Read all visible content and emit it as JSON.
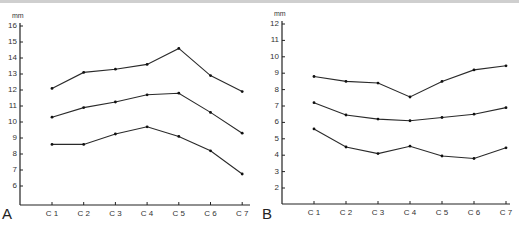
{
  "chart_data": [
    {
      "type": "line",
      "panel_label": "A",
      "title": "",
      "xlabel": "",
      "ylabel": "mm",
      "categories": [
        "C1",
        "C2",
        "C3",
        "C4",
        "C5",
        "C6",
        "C7"
      ],
      "yticks": [
        6,
        7,
        8,
        9,
        10,
        11,
        12,
        13,
        14,
        15,
        16
      ],
      "ylim": [
        5,
        16
      ],
      "grid": false,
      "legend": null,
      "series": [
        {
          "name": "upper",
          "values": [
            12.1,
            13.1,
            13.3,
            13.6,
            14.6,
            12.9,
            11.9
          ]
        },
        {
          "name": "middle",
          "values": [
            10.3,
            10.9,
            11.25,
            11.7,
            11.8,
            10.6,
            9.3
          ]
        },
        {
          "name": "lower",
          "values": [
            8.6,
            8.6,
            9.25,
            9.7,
            9.1,
            8.2,
            6.75
          ]
        }
      ]
    },
    {
      "type": "line",
      "panel_label": "B",
      "title": "",
      "xlabel": "",
      "ylabel": "mm",
      "categories": [
        "C1",
        "C2",
        "C3",
        "C4",
        "C5",
        "C6",
        "C7"
      ],
      "yticks": [
        2,
        3,
        4,
        5,
        6,
        7,
        8,
        9,
        10,
        11,
        12
      ],
      "ylim": [
        1,
        12
      ],
      "grid": false,
      "legend": null,
      "series": [
        {
          "name": "upper",
          "values": [
            8.8,
            8.5,
            8.4,
            7.55,
            8.5,
            9.2,
            9.45
          ]
        },
        {
          "name": "middle",
          "values": [
            7.2,
            6.45,
            6.2,
            6.1,
            6.3,
            6.5,
            6.9
          ]
        },
        {
          "name": "lower",
          "values": [
            5.6,
            4.5,
            4.1,
            4.55,
            3.95,
            3.8,
            4.45
          ]
        }
      ]
    }
  ]
}
